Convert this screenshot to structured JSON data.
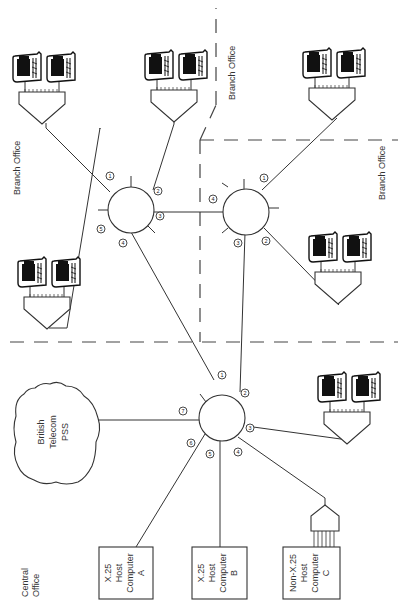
{
  "diagram": {
    "regions": {
      "central_office": "Central\nOffice",
      "branch_office_left": "Branch Office",
      "branch_office_top_right": "Branch Office",
      "branch_office_right": "Branch Office"
    },
    "cloud": {
      "label_line1": "British",
      "label_line2": "Telecom",
      "label_line3": "PSS"
    },
    "hosts": [
      {
        "line1": "X.25",
        "line2": "Host",
        "line3": "Computer",
        "line4": "A"
      },
      {
        "line1": "X.25",
        "line2": "Host",
        "line3": "Computer",
        "line4": "B"
      },
      {
        "line1": "Non-X.25",
        "line2": "Host",
        "line3": "Computer",
        "line4": "C"
      }
    ],
    "nodes": {
      "central": {
        "ports": [
          "1",
          "2",
          "3",
          "4",
          "5",
          "6",
          "7"
        ]
      },
      "branch_left": {
        "ports": [
          "1",
          "2",
          "3",
          "4",
          "5"
        ]
      },
      "branch_right": {
        "ports": [
          "1",
          "2",
          "3",
          "4"
        ]
      }
    },
    "terminal_clusters": 6
  }
}
